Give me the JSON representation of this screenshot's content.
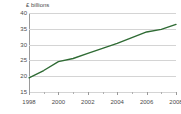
{
  "chart_data": {
    "type": "line",
    "title": "",
    "axis_note": "£ billions",
    "xlabel": "",
    "ylabel": "£ billions",
    "grid": true,
    "legend": false,
    "line_color": "#2f6b34",
    "xlim": [
      1998,
      2008
    ],
    "ylim": [
      15,
      40
    ],
    "yticks": [
      40,
      35,
      30,
      25,
      20,
      15
    ],
    "xticks": [
      1998,
      2000,
      2002,
      2004,
      2006,
      2008
    ],
    "xticks_minor": [
      1999,
      2001,
      2003,
      2005,
      2007
    ],
    "x": [
      1998,
      1999,
      2000,
      2001,
      2002,
      2003,
      2004,
      2005,
      2006,
      2007,
      2008
    ],
    "values": [
      19.5,
      21.8,
      24.6,
      25.6,
      27.2,
      28.8,
      30.4,
      32.2,
      34.0,
      34.8,
      36.4
    ],
    "series": [
      {
        "name": "Value",
        "values": [
          19.5,
          21.8,
          24.6,
          25.6,
          27.2,
          28.8,
          30.4,
          32.2,
          34.0,
          34.8,
          36.4
        ]
      }
    ]
  },
  "axis": {
    "y_title": "£ billions",
    "y_labels": [
      "40",
      "35",
      "30",
      "25",
      "20",
      "15"
    ],
    "x_labels": [
      "1998",
      "2000",
      "2002",
      "2004",
      "2006",
      "2008"
    ]
  }
}
